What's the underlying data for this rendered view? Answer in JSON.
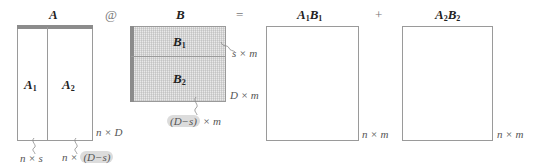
{
  "matrices": {
    "A": {
      "title": "A",
      "part1": "A",
      "part1_sub": "1",
      "part2": "A",
      "part2_sub": "2",
      "dim": "n × D",
      "part1_dim": "n × s",
      "part2_dim_prefix": "n ×",
      "part2_dim_highlight": "(D−s)"
    },
    "B": {
      "title": "B",
      "part1": "B",
      "part1_sub": "1",
      "part2": "B",
      "part2_sub": "2",
      "dim": "D × m",
      "part1_dim": "s × m",
      "part2_dim_highlight": "(D−s)",
      "part2_dim_suffix": "× m"
    },
    "A1B1": {
      "t1": "A",
      "s1": "1",
      "t2": "B",
      "s2": "1",
      "dim": "n × m"
    },
    "A2B2": {
      "t1": "A",
      "s1": "2",
      "t2": "B",
      "s2": "2",
      "dim": "n × m"
    }
  },
  "operators": {
    "matmul": "@",
    "equals": "=",
    "plus": "+"
  },
  "colors": {
    "border": "#9a9a9a",
    "bar": "#8c8c8c",
    "fill_B": "#e9e9e9",
    "highlight": "#dcdcdc"
  }
}
